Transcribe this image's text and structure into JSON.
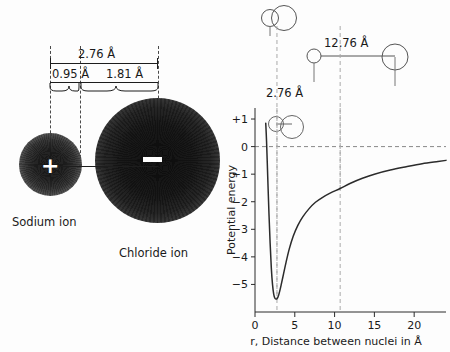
{
  "figure": {
    "left_panel": {
      "title_hidden": "",
      "ions": [
        {
          "name": "Sodium ion",
          "charge_glyph": "+",
          "radius_label": "0.95 Å"
        },
        {
          "name": "Chloride ion",
          "charge_glyph": "−",
          "radius_label": "1.81 Å"
        }
      ],
      "dimensions": {
        "total": "2.76 Å",
        "cation_radius": "0.95 Å",
        "anion_radius": "1.81 Å"
      },
      "labels": {
        "sodium": "Sodium ion",
        "chloride": "Chloride ion"
      }
    },
    "right_panel": {
      "annotations": [
        {
          "id": "contact-distance",
          "label": "2.76 Å"
        },
        {
          "id": "separated-distance",
          "label": "12.76 Å"
        }
      ]
    }
  },
  "chart_data": {
    "type": "line",
    "title": "",
    "xlabel": "r, Distance between nuclei in Å",
    "ylabel": "Potential energy",
    "xlim": [
      0,
      24
    ],
    "ylim": [
      -6,
      1.4
    ],
    "xticks": [
      0,
      5,
      10,
      15,
      20
    ],
    "xtick_labels": [
      "0",
      "5",
      "10",
      "15",
      "20"
    ],
    "yticks": [
      1,
      0,
      -1,
      -2,
      -3,
      -4,
      -5
    ],
    "ytick_labels": [
      "+1",
      "0",
      "−1",
      "−2",
      "−3",
      "−4",
      "−5"
    ],
    "grid": false,
    "legend": null,
    "zero_reference_line": 0,
    "equilibrium_distance": 2.76,
    "well_depth": -5.5,
    "dashed_markers_x": [
      2.76,
      10.7
    ],
    "series": [
      {
        "name": "Potential energy of Na+ Cl- ion pair",
        "x": [
          1.35,
          1.45,
          1.6,
          1.75,
          1.9,
          2.05,
          2.2,
          2.35,
          2.5,
          2.65,
          2.76,
          2.9,
          3.1,
          3.3,
          3.6,
          3.9,
          4.3,
          4.8,
          5.4,
          6.0,
          6.8,
          7.6,
          8.5,
          9.5,
          10.7,
          12.0,
          13.5,
          15.0,
          17.0,
          19.0,
          21.0,
          23.0,
          24.0
        ],
        "y": [
          0.85,
          0.2,
          -1.1,
          -2.4,
          -3.5,
          -4.4,
          -5.0,
          -5.35,
          -5.5,
          -5.53,
          -5.52,
          -5.45,
          -5.25,
          -5.0,
          -4.6,
          -4.2,
          -3.72,
          -3.25,
          -2.85,
          -2.55,
          -2.25,
          -2.02,
          -1.84,
          -1.68,
          -1.52,
          -1.33,
          -1.15,
          -1.0,
          -0.85,
          -0.73,
          -0.62,
          -0.54,
          -0.5
        ]
      }
    ],
    "callouts": [
      {
        "label": "2.76 Å",
        "x_value": 2.76,
        "description": "ions in contact, at potential-energy minimum"
      },
      {
        "label": "12.76 Å",
        "x_value": 10.7,
        "description": "ions separated by 10 Å of empty space"
      }
    ]
  }
}
